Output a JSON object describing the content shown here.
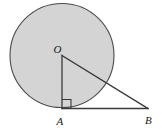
{
  "figure": {
    "kind": "geometry-diagram",
    "background_color": "#ffffff",
    "circle": {
      "fill_color": "#d4d4d4",
      "stroke_color": "#4a4a4a",
      "center_label": "O",
      "cx": 62,
      "cy": 55.5,
      "r": 52,
      "stroke_width": 1.1
    },
    "triangle": {
      "stroke_color": "#3a3a3a",
      "stroke_width": 1.3,
      "vertices": [
        {
          "label": "O",
          "x": 62,
          "y": 55.5
        },
        {
          "label": "A",
          "x": 62,
          "y": 108.5
        },
        {
          "label": "B",
          "x": 148,
          "y": 108.5
        }
      ]
    },
    "right_angle_marker": {
      "at_vertex": "A",
      "size": 9,
      "stroke_color": "#3a3a3a",
      "stroke_width": 1.1
    },
    "labels": {
      "center": {
        "text": "O",
        "x": 53.5,
        "y": 53
      },
      "tangent_point": {
        "text": "A",
        "x": 56.5,
        "y": 125
      },
      "far_point": {
        "text": "B",
        "x": 145,
        "y": 124
      }
    }
  }
}
